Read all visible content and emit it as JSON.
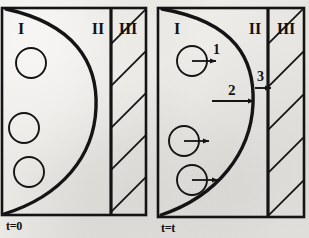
{
  "figure": {
    "type": "scientific-schematic",
    "background_color": "#e9e7e3",
    "ink_color": "#111111"
  },
  "panels": [
    {
      "id": "panel-left",
      "caption": "t=0",
      "regions": [
        {
          "id": "region-I",
          "label": "I"
        },
        {
          "id": "region-II",
          "label": "II"
        },
        {
          "id": "region-III",
          "label": "III",
          "hatched": true
        }
      ],
      "particles": [
        {
          "id": "particle-1",
          "cx": 31,
          "cy": 63,
          "r": 15,
          "arrow": false,
          "label": ""
        },
        {
          "id": "particle-2",
          "cx": 24,
          "cy": 128,
          "r": 15,
          "arrow": false,
          "label": ""
        },
        {
          "id": "particle-3",
          "cx": 29,
          "cy": 172,
          "r": 15,
          "arrow": false,
          "label": ""
        }
      ],
      "arrows": []
    },
    {
      "id": "panel-right",
      "caption": "t=t",
      "regions": [
        {
          "id": "region-I",
          "label": "I"
        },
        {
          "id": "region-II",
          "label": "II"
        },
        {
          "id": "region-III",
          "label": "III",
          "hatched": true
        }
      ],
      "particles": [
        {
          "id": "particle-1",
          "cx": 192,
          "cy": 61,
          "r": 15,
          "arrow": true,
          "label": "1"
        },
        {
          "id": "particle-2",
          "cx": 184,
          "cy": 141,
          "r": 15,
          "arrow": true,
          "label": ""
        },
        {
          "id": "particle-3",
          "cx": 192,
          "cy": 180,
          "r": 15,
          "arrow": true,
          "label": ""
        }
      ],
      "arrows": [
        {
          "id": "arrow-2",
          "label": "2",
          "from_x": 213,
          "to_x": 253,
          "y": 101
        },
        {
          "id": "arrow-3",
          "label": "3",
          "from_x": 255,
          "to_x": 271,
          "y": 88
        }
      ]
    }
  ],
  "labels": {
    "region_I": "I",
    "region_II": "II",
    "region_III": "III",
    "flux_1": "1",
    "flux_2": "2",
    "flux_3": "3",
    "time_initial": "t=0",
    "time_later": "t=t"
  }
}
